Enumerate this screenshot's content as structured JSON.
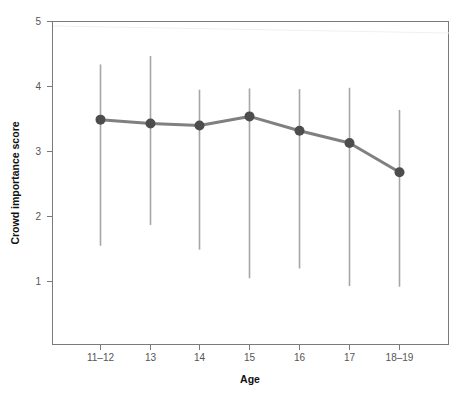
{
  "chart_data": {
    "type": "line",
    "title": "",
    "subtitle": "",
    "xlabel": "Age",
    "ylabel": "Crowd importance score",
    "categories": [
      "11–12",
      "13",
      "14",
      "15",
      "16",
      "17",
      "18–19"
    ],
    "values": [
      3.49,
      3.43,
      3.4,
      3.54,
      3.32,
      3.13,
      2.68
    ],
    "error_bars": {
      "lower": [
        1.55,
        1.87,
        1.49,
        1.05,
        1.2,
        0.93,
        0.92
      ],
      "upper": [
        4.34,
        4.47,
        3.95,
        3.97,
        3.96,
        3.98,
        3.64
      ]
    },
    "series": [
      {
        "name": "Crowd importance score",
        "values": [
          3.49,
          3.43,
          3.4,
          3.54,
          3.32,
          3.13,
          2.68
        ]
      }
    ],
    "ylim": [
      0.38,
      5
    ],
    "yticks": [
      1,
      2,
      3,
      4,
      5
    ],
    "ytick_labels": [
      "1",
      "2",
      "3",
      "4",
      "5"
    ],
    "xtick_labels": [
      "11–12",
      "13",
      "14",
      "15",
      "16",
      "17",
      "18–19"
    ],
    "grid": false,
    "legend": "none",
    "marker": "circle",
    "colors": {
      "line": "#808080",
      "marker": "#4d4d4d",
      "error_bar": "#a6a6a6",
      "axis": "#7a7a7a",
      "tick_text": "#555555",
      "title_text": "#111111",
      "background": "#ffffff"
    }
  },
  "axes": {
    "y_title": "Crowd importance score",
    "x_title": "Age",
    "y_ticks": [
      "5",
      "4",
      "3",
      "2",
      "1"
    ],
    "x_ticks": [
      "11–12",
      "13",
      "14",
      "15",
      "16",
      "17",
      "18–19"
    ]
  }
}
